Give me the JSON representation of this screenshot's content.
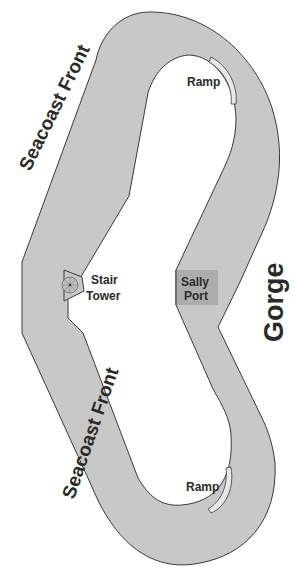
{
  "diagram": {
    "type": "fort-plan",
    "colors": {
      "wall_fill": "#c8c8c8",
      "outline": "#3a3a3a",
      "sally_port_fill": "#a9a9a9",
      "ramp_fill": "#e9e9e9",
      "text": "#2a2a2a",
      "background": "#ffffff"
    },
    "labels": {
      "seacoast_front_upper": "Seacoast Front",
      "seacoast_front_lower": "Seacoast Front",
      "gorge": "Gorge",
      "stair_tower_line1": "Stair",
      "stair_tower_line2": "Tower",
      "sally_port_line1": "Sally",
      "sally_port_line2": "Port",
      "ramp_upper": "Ramp",
      "ramp_lower": "Ramp"
    },
    "icons": {
      "stair_tower": "spiral-stair-icon"
    }
  }
}
